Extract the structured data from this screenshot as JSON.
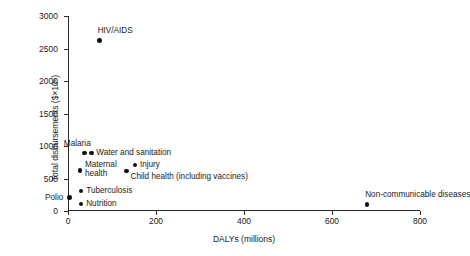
{
  "chart_data": {
    "type": "scatter",
    "title": "",
    "xlabel": "DALYs (millions)",
    "ylabel": "Total disbursements ($×10⁶)",
    "xlim": [
      0,
      800
    ],
    "ylim": [
      0,
      3000
    ],
    "xticks": [
      "0",
      "200",
      "400",
      "600",
      "800"
    ],
    "yticks": [
      "0",
      "500",
      "1000",
      "1500",
      "2000",
      "2500",
      "3000"
    ],
    "xtick_values": [
      0,
      200,
      400,
      600,
      800
    ],
    "ytick_values": [
      0,
      500,
      1000,
      1500,
      2000,
      2500,
      3000
    ],
    "grid": false,
    "legend": "none",
    "marker_color": "#111111",
    "axis_color": "#2b2b2b",
    "points": [
      {
        "label": "HIV/AIDS",
        "x": 72,
        "y": 2620,
        "label_pos": "above"
      },
      {
        "label": "Malaria",
        "x": 38,
        "y": 890,
        "label_pos": "above-left"
      },
      {
        "label": "Water and sanitation",
        "x": 53,
        "y": 890,
        "label_pos": "right"
      },
      {
        "label": "Injury",
        "x": 152,
        "y": 710,
        "label_pos": "right"
      },
      {
        "label": "Maternal health",
        "x": 27,
        "y": 625,
        "label_pos": "right-twoline"
      },
      {
        "label": "Child health (including vaccines)",
        "x": 133,
        "y": 615,
        "label_pos": "below-right"
      },
      {
        "label": "Tuberculosis",
        "x": 30,
        "y": 305,
        "label_pos": "right"
      },
      {
        "label": "Polio",
        "x": 3,
        "y": 205,
        "label_pos": "left"
      },
      {
        "label": "Nutrition",
        "x": 30,
        "y": 110,
        "label_pos": "right"
      },
      {
        "label": "Non-communicable diseases",
        "x": 680,
        "y": 100,
        "label_pos": "above"
      }
    ]
  }
}
